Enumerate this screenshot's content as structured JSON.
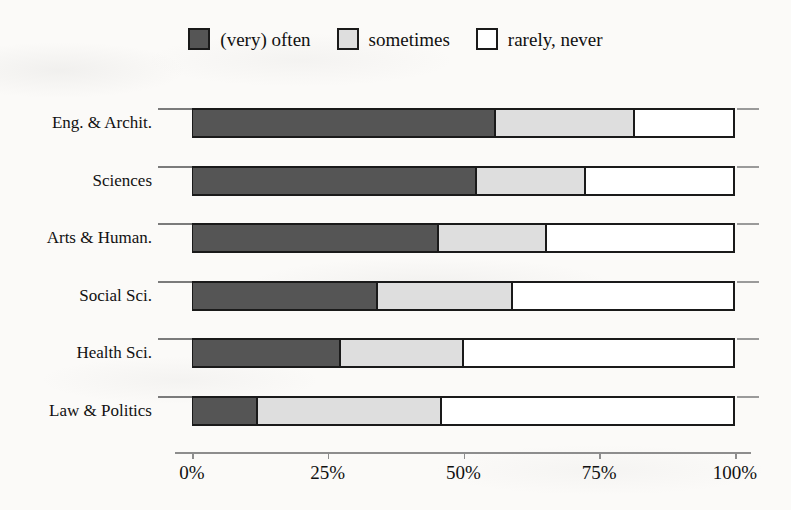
{
  "chart_data": {
    "type": "bar",
    "subtype": "stacked-horizontal-100pct",
    "title": "",
    "subtitle": "",
    "xlabel": "",
    "ylabel": "",
    "xlim": [
      0,
      100
    ],
    "xtick_labels": [
      "0%",
      "25%",
      "50%",
      "75%",
      "100%"
    ],
    "xticks": [
      0,
      25,
      50,
      75,
      100
    ],
    "grid": false,
    "legend_position": "top-center",
    "categories": [
      "Eng. & Archit.",
      "Sciences",
      "Arts & Human.",
      "Social Sci.",
      "Health Sci.",
      "Law & Politics"
    ],
    "series": [
      {
        "name": "(very) often",
        "color": "#555555",
        "values": [
          55.8,
          52.3,
          45.3,
          34.1,
          27.3,
          12.0
        ]
      },
      {
        "name": "sometimes",
        "color": "#dedede",
        "values": [
          25.6,
          20.1,
          19.9,
          24.8,
          22.6,
          33.8
        ]
      },
      {
        "name": "rarely, never",
        "color": "#ffffff",
        "values": [
          18.6,
          27.6,
          34.8,
          41.1,
          50.1,
          54.2
        ]
      }
    ]
  },
  "legend": {
    "items": [
      {
        "label": "(very) often",
        "color": "#555555"
      },
      {
        "label": "sometimes",
        "color": "#dedede"
      },
      {
        "label": "rarely, never",
        "color": "#ffffff"
      }
    ]
  },
  "colors": {
    "often": "#555555",
    "sometimes": "#dedede",
    "rarely": "#ffffff",
    "outline": "#1a1a1a",
    "axis": "#8d8d8d",
    "background": "#fbfaf8"
  }
}
